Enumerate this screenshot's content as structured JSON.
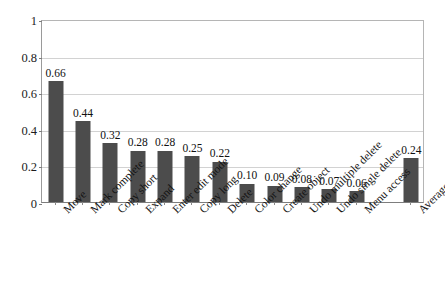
{
  "chart_data": {
    "type": "bar",
    "title": "",
    "subtitle": "",
    "xlabel": "",
    "ylabel": "",
    "ylim": [
      0,
      1
    ],
    "yticks": [
      "0",
      "0.2",
      "0.4",
      "0.6",
      "0.8",
      "1"
    ],
    "ytick_values": [
      0,
      0.2,
      0.4,
      0.6,
      0.8,
      1
    ],
    "grid": "horizontal",
    "legend": "none",
    "bar_color": "#4c4c4c",
    "categories": [
      "Move",
      "Mark complete",
      "Copy short",
      "Expand",
      "Enter edit mode",
      "Copy long",
      "Delete",
      "Color change",
      "Create object",
      "Undo multiple delete",
      "Undo single delete",
      "Menu access",
      "Average"
    ],
    "values": [
      0.66,
      0.44,
      0.32,
      0.28,
      0.28,
      0.25,
      0.22,
      0.1,
      0.09,
      0.08,
      0.07,
      0.06,
      0.24
    ],
    "value_labels": [
      "0.66",
      "0.44",
      "0.32",
      "0.28",
      "0.28",
      "0.25",
      "0.22",
      "0.10",
      "0.09",
      "0.08",
      "0.07",
      "0.06",
      "0.24"
    ],
    "slot_indices": [
      0,
      1,
      2,
      3,
      4,
      5,
      6,
      7,
      8,
      9,
      10,
      11,
      13
    ],
    "total_slots": 14,
    "gap_note": "empty slot between 'Menu access' and 'Average'"
  }
}
